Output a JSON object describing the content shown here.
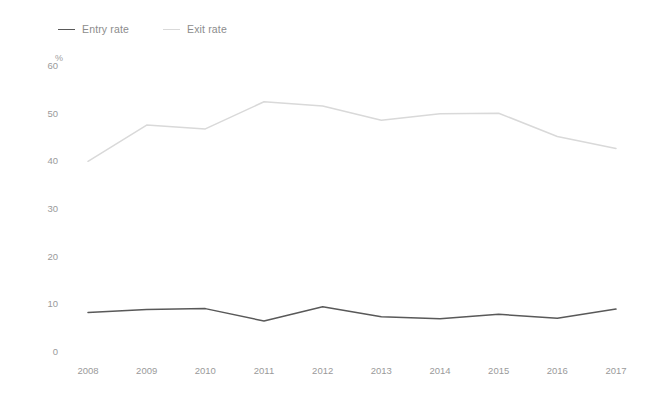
{
  "chart_data": {
    "type": "line",
    "title": "",
    "subtitle": "",
    "xlabel": "",
    "ylabel": "",
    "unit_label": "%",
    "categories": [
      "2008",
      "2009",
      "2010",
      "2011",
      "2012",
      "2013",
      "2014",
      "2015",
      "2016",
      "2017"
    ],
    "x": [
      2008,
      2009,
      2010,
      2011,
      2012,
      2013,
      2014,
      2015,
      2016,
      2017
    ],
    "series": [
      {
        "name": "Entry rate",
        "color": "#595959",
        "values": [
          8.3,
          8.9,
          9.1,
          6.5,
          9.5,
          7.4,
          7.0,
          7.9,
          7.1,
          9.0
        ]
      },
      {
        "name": "Exit rate",
        "color": "#d9d9d9",
        "values": [
          40.0,
          47.6,
          46.8,
          52.5,
          51.6,
          48.6,
          50.0,
          50.1,
          45.2,
          42.7
        ]
      }
    ],
    "ylim": [
      0,
      60
    ],
    "yticks": [
      0,
      10,
      20,
      30,
      40,
      50,
      60
    ],
    "ytick_labels": [
      "0",
      "10",
      "20",
      "30",
      "40",
      "50",
      "60"
    ],
    "grid": false,
    "legend_position": "top-left",
    "legend_entries": [
      "Entry rate",
      "Exit rate"
    ]
  },
  "style": {
    "background": "#ffffff",
    "axis_text_color": "#9a9a9a",
    "legend_text_color": "#8c8c8c",
    "entry_color": "#595959",
    "exit_color": "#d9d9d9"
  }
}
